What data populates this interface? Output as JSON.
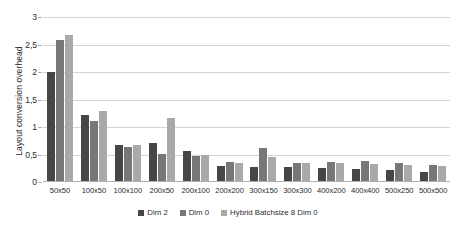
{
  "chart_data": {
    "type": "bar",
    "title": "",
    "xlabel": "",
    "ylabel": "Layout conversion overhead",
    "ylim": [
      0,
      3
    ],
    "yticks": [
      "0",
      "0,5",
      "1",
      "1,5",
      "2",
      "2,5",
      "3"
    ],
    "ytick_values": [
      0,
      0.5,
      1,
      1.5,
      2,
      2.5,
      3
    ],
    "grid": true,
    "legend_position": "bottom",
    "categories": [
      "50x50",
      "100x50",
      "100x100",
      "200x50",
      "200x100",
      "200x200",
      "300x150",
      "300x300",
      "400x200",
      "400x400",
      "500x250",
      "500x500"
    ],
    "series": [
      {
        "name": "Dim 2",
        "color": "#464646",
        "values": [
          2.0,
          1.21,
          0.67,
          0.71,
          0.57,
          0.3,
          0.27,
          0.28,
          0.25,
          0.24,
          0.22,
          0.19
        ]
      },
      {
        "name": "Dim 0",
        "color": "#777777",
        "values": [
          2.58,
          1.11,
          0.64,
          0.51,
          0.47,
          0.37,
          0.61,
          0.35,
          0.37,
          0.38,
          0.35,
          0.31
        ]
      },
      {
        "name": "Hybrid Batchsize 8 Dim 0",
        "color": "#a9a9a9",
        "values": [
          2.67,
          1.29,
          0.68,
          1.17,
          0.49,
          0.35,
          0.45,
          0.35,
          0.34,
          0.33,
          0.31,
          0.3
        ]
      }
    ]
  }
}
